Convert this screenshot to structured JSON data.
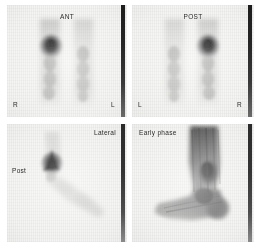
{
  "figure": {
    "name": "three-phase-bone-scintigraphy-panel",
    "background_color": "#ffffff",
    "panel_background_color": "#f3f3f1",
    "marker_strip_color": "#1d1d1d",
    "uptake_color": "#1a1a1a"
  },
  "panels": [
    {
      "id": "anterior",
      "position": "top-left",
      "view_label": "ANT",
      "left_side_label": "R",
      "right_side_label": "L",
      "description": "Anterior whole-leg delayed bone scan, intense focal uptake in right ankle"
    },
    {
      "id": "posterior",
      "position": "top-right",
      "view_label": "POST",
      "left_side_label": "L",
      "right_side_label": "R",
      "description": "Posterior whole-leg delayed bone scan, intense focal uptake in right ankle"
    },
    {
      "id": "lateral",
      "position": "bottom-left",
      "view_label": "Lateral",
      "orientation_label": "Post",
      "description": "Lateral foot delayed bone scan with focal hindfoot uptake"
    },
    {
      "id": "early-phase",
      "position": "bottom-right",
      "view_label": "Early phase",
      "description": "Early phase blood-pool lateral foot image with diffuse increased perfusion"
    }
  ]
}
